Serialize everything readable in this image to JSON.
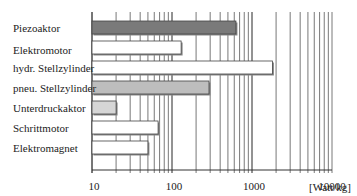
{
  "chart_data": {
    "type": "bar",
    "orientation": "horizontal",
    "title": "",
    "xlabel": "[Watt/kg]",
    "ylabel": "",
    "xscale": "log",
    "xlim": [
      10,
      10000
    ],
    "xticks": [
      "10",
      "100",
      "1000",
      "10000"
    ],
    "grid": true,
    "categories": [
      "Piezoaktor",
      "Elektromotor",
      "hydr. Stellzylinder",
      "pneu. Stellzylinder",
      "Unterdruckaktor",
      "Schrittmotor",
      "Elektromagnet"
    ],
    "values": [
      630,
      130,
      1800,
      290,
      20,
      67,
      50
    ],
    "colors": [
      "#7a7a7a",
      "#ffffff",
      "#ffffff",
      "#bdbdbd",
      "#d6d6d6",
      "#ffffff",
      "#ffffff"
    ]
  },
  "labels": {
    "cat0": "Piezoaktor",
    "cat1": "Elektromotor",
    "cat2": "hydr. Stellzylinder",
    "cat3": "pneu. Stellzylinder",
    "cat4": "Unterdruckaktor",
    "cat5": "Schrittmotor",
    "cat6": "Elektromagnet",
    "t0": "10",
    "t1": "100",
    "t2": "1000",
    "t3": "10000",
    "unit": "[Watt/kg]"
  }
}
